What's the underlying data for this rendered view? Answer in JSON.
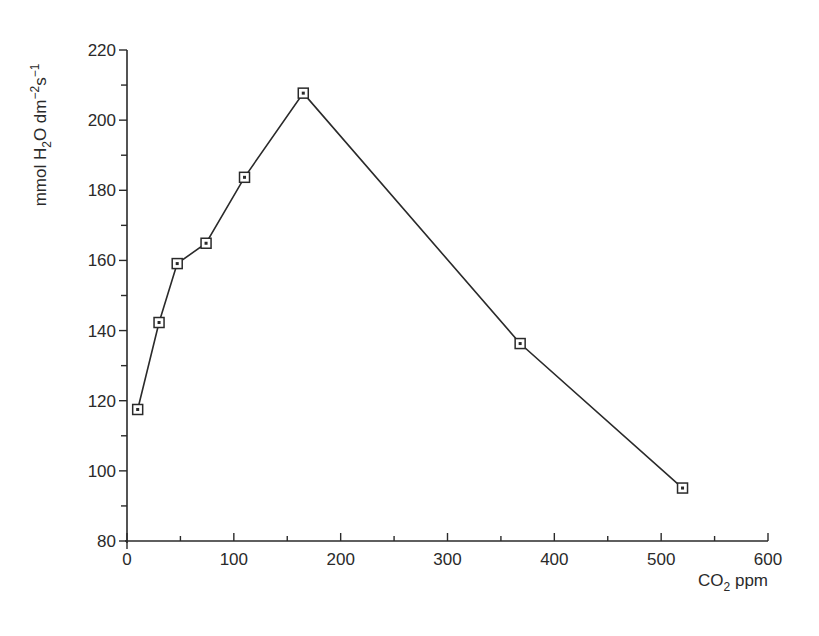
{
  "chart_data": {
    "type": "line",
    "title": "",
    "xlabel": "CO2 ppm",
    "ylabel": "mmol H2O dm-2s-1",
    "xlim": [
      0,
      600
    ],
    "ylim": [
      80,
      220
    ],
    "x_ticks": [
      0,
      100,
      200,
      300,
      400,
      500,
      600
    ],
    "x_minor_step": 50,
    "y_ticks": [
      80,
      100,
      120,
      140,
      160,
      180,
      200,
      220
    ],
    "y_minor_step": 10,
    "grid": false,
    "legend": null,
    "marker": "square-with-center-dot",
    "series": [
      {
        "name": "H2O flux",
        "x": [
          10,
          30,
          47,
          74,
          110,
          165,
          368,
          520
        ],
        "y": [
          117.5,
          142.3,
          159.1,
          164.9,
          183.7,
          207.7,
          136.3,
          95.1
        ]
      }
    ]
  },
  "labels": {
    "ylabel_main": "mmol H",
    "ylabel_sub": "2",
    "ylabel_mid": "O dm",
    "ylabel_sup1": "−2",
    "ylabel_s": "s",
    "ylabel_sup2": "−1",
    "xlabel_main": "CO",
    "xlabel_sub": "2",
    "xlabel_tail": " ppm"
  }
}
